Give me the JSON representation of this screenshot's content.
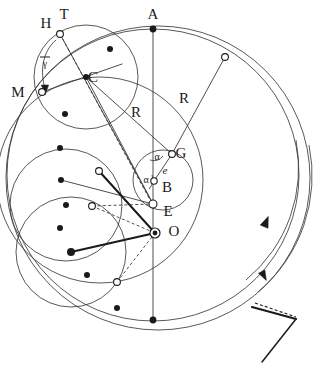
{
  "figure": {
    "background_color": "#ffffff",
    "stroke_color": "#3a3a3a",
    "stroke_color_dark": "#1a1a1a",
    "label_color": "#1a1a1a",
    "width": 317,
    "height": 375
  },
  "labels": [
    {
      "key": "A",
      "text": "A",
      "x": 153,
      "y": 16,
      "size": "large",
      "name": "label-A"
    },
    {
      "key": "T",
      "text": "T",
      "x": 64,
      "y": 16,
      "size": "large",
      "name": "label-T"
    },
    {
      "key": "H",
      "text": "H",
      "x": 46,
      "y": 25,
      "size": "large",
      "name": "label-H"
    },
    {
      "key": "M",
      "text": "M",
      "x": 18,
      "y": 94,
      "size": "large",
      "name": "label-M"
    },
    {
      "key": "C",
      "text": "C",
      "x": 93,
      "y": 79,
      "size": "large",
      "name": "label-C"
    },
    {
      "key": "G",
      "text": "G",
      "x": 181,
      "y": 155,
      "size": "large",
      "name": "label-G"
    },
    {
      "key": "B",
      "text": "B",
      "x": 167,
      "y": 189,
      "size": "large",
      "name": "label-B"
    },
    {
      "key": "E",
      "text": "E",
      "x": 168,
      "y": 213,
      "size": "large",
      "name": "label-E"
    },
    {
      "key": "O",
      "text": "O",
      "x": 174,
      "y": 233,
      "size": "large",
      "name": "label-O"
    },
    {
      "key": "R1",
      "text": "R",
      "x": 136,
      "y": 114,
      "size": "large",
      "name": "label-R-left"
    },
    {
      "key": "R2",
      "text": "R",
      "x": 184,
      "y": 100,
      "size": "large",
      "name": "label-R-right"
    },
    {
      "key": "e",
      "text": "e",
      "x": 165,
      "y": 171,
      "size": "italic",
      "name": "label-e"
    },
    {
      "key": "a1",
      "text": "α",
      "x": 157,
      "y": 158,
      "size": "small",
      "name": "label-alpha-upper"
    },
    {
      "key": "a2",
      "text": "α",
      "x": 146,
      "y": 181,
      "size": "small",
      "name": "label-alpha-lower"
    },
    {
      "key": "g",
      "text": "γ",
      "x": 45,
      "y": 65,
      "size": "small",
      "name": "label-gamma"
    }
  ],
  "gamma_overbar": {
    "x": 40,
    "y": 57,
    "width": 10,
    "name": "gamma-overbar"
  },
  "points": {
    "filled": [
      {
        "x": 153,
        "y": 29,
        "r": 3.4,
        "name": "point-A-marker"
      },
      {
        "x": 86,
        "y": 77,
        "r": 3.0,
        "name": "point-C-marker"
      },
      {
        "x": 110,
        "y": 49,
        "r": 3.0,
        "name": "point-dot-top-circle"
      },
      {
        "x": 65,
        "y": 114,
        "r": 3.0,
        "name": "point-dot-1"
      },
      {
        "x": 60,
        "y": 148,
        "r": 3.0,
        "name": "point-dot-2"
      },
      {
        "x": 61,
        "y": 180,
        "r": 3.0,
        "name": "point-dot-3"
      },
      {
        "x": 66,
        "y": 205,
        "r": 3.0,
        "name": "point-dot-4"
      },
      {
        "x": 60,
        "y": 228,
        "r": 3.0,
        "name": "point-dot-5"
      },
      {
        "x": 71,
        "y": 252,
        "r": 4.0,
        "name": "point-dot-6-thick"
      },
      {
        "x": 87,
        "y": 275,
        "r": 3.0,
        "name": "point-dot-7"
      },
      {
        "x": 117,
        "y": 308,
        "r": 3.0,
        "name": "point-dot-8"
      },
      {
        "x": 153,
        "y": 320,
        "r": 3.4,
        "name": "point-bottom-marker"
      }
    ],
    "open": [
      {
        "x": 60,
        "y": 34,
        "r": 3.4,
        "name": "point-T-marker"
      },
      {
        "x": 42,
        "y": 92,
        "r": 3.4,
        "name": "point-M-marker"
      },
      {
        "x": 225,
        "y": 57,
        "r": 3.4,
        "name": "point-upper-right-marker"
      },
      {
        "x": 172,
        "y": 154,
        "r": 3.4,
        "name": "point-G-marker"
      },
      {
        "x": 154,
        "y": 181,
        "r": 3.2,
        "name": "point-alpha-vertex-marker"
      },
      {
        "x": 153,
        "y": 204,
        "r": 4.0,
        "name": "point-E-marker"
      },
      {
        "x": 99,
        "y": 171,
        "r": 3.4,
        "name": "point-upper-left-node"
      },
      {
        "x": 92,
        "y": 206,
        "r": 3.4,
        "name": "point-mid-left-node"
      },
      {
        "x": 117,
        "y": 282,
        "r": 3.4,
        "name": "point-lower-node"
      }
    ],
    "double": [
      {
        "x": 155,
        "y": 233,
        "r_outer": 5.0,
        "r_inner": 2.4,
        "name": "point-O-marker"
      }
    ]
  },
  "circles": [
    {
      "cx": 153,
      "cy": 175,
      "r": 146,
      "name": "circle-deferent-main"
    },
    {
      "cx": 158,
      "cy": 178,
      "r": 152,
      "name": "circle-outer-secondary"
    },
    {
      "cx": 86,
      "cy": 77,
      "r": 52,
      "name": "circle-epicycle-upper"
    },
    {
      "cx": 66,
      "cy": 205,
      "r": 56,
      "name": "circle-epicycle-left"
    },
    {
      "cx": 71,
      "cy": 252,
      "r": 55,
      "name": "circle-epicycle-lower"
    },
    {
      "cx": 100,
      "cy": 180,
      "r": 103,
      "name": "circle-mid-large"
    },
    {
      "cx": 163,
      "cy": 180,
      "r": 30,
      "name": "circle-small-eccentric"
    }
  ],
  "lines": {
    "solid": [
      {
        "x1": 153,
        "y1": 29,
        "x2": 153,
        "y2": 320,
        "name": "line-vertical-axis",
        "w": 0.9
      },
      {
        "x1": 60,
        "y1": 34,
        "x2": 153,
        "y2": 204,
        "name": "line-T-to-E",
        "w": 0.9
      },
      {
        "x1": 42,
        "y1": 92,
        "x2": 122,
        "y2": 64,
        "name": "line-M-to-upper-right",
        "w": 0.9
      },
      {
        "x1": 86,
        "y1": 77,
        "x2": 172,
        "y2": 154,
        "name": "line-C-to-G-radius-R",
        "w": 0.9
      },
      {
        "x1": 172,
        "y1": 154,
        "x2": 225,
        "y2": 57,
        "name": "line-G-to-outer-radius-R",
        "w": 0.9
      },
      {
        "x1": 154,
        "y1": 181,
        "x2": 172,
        "y2": 154,
        "name": "line-e-eccentricity",
        "w": 0.9
      },
      {
        "x1": 86,
        "y1": 77,
        "x2": 153,
        "y2": 204,
        "name": "line-C-to-E",
        "w": 0.9
      },
      {
        "x1": 61,
        "y1": 180,
        "x2": 153,
        "y2": 204,
        "name": "line-dot3-to-E-horizontal",
        "w": 0.9
      },
      {
        "x1": 99,
        "y1": 171,
        "x2": 155,
        "y2": 233,
        "name": "line-node-to-O-thick",
        "w": 2.0
      },
      {
        "x1": 71,
        "y1": 252,
        "x2": 155,
        "y2": 233,
        "name": "line-dot6-to-O-thick",
        "w": 2.0
      }
    ],
    "dashed": [
      {
        "x1": 60,
        "y1": 34,
        "x2": 150,
        "y2": 200,
        "name": "line-T-to-E-dashed",
        "w": 0.9
      },
      {
        "x1": 92,
        "y1": 206,
        "x2": 155,
        "y2": 233,
        "name": "line-mid-node-to-O-dashed",
        "w": 0.9
      },
      {
        "x1": 117,
        "y1": 282,
        "x2": 155,
        "y2": 233,
        "name": "line-lower-node-to-O-dashed",
        "w": 0.9
      },
      {
        "x1": 92,
        "y1": 206,
        "x2": 153,
        "y2": 204,
        "name": "line-mid-node-to-E-dashed",
        "w": 0.9
      }
    ]
  },
  "arcs": {
    "gamma_angle": {
      "name": "arc-gamma-angle",
      "d": "M 56 40 C 42 52 40 72 45 88"
    },
    "alpha_upper": {
      "name": "arc-alpha-upper",
      "d": "M 150 160 A 12 12 0 0 0 163 156"
    },
    "alpha_lower": {
      "name": "arc-alpha-lower",
      "d": "M 149 189 A 14 14 0 0 0 152 175"
    },
    "rotation_inner": {
      "name": "arc-rotation-inner",
      "d": "M 296 140 A 146 146 0 0 1 246 280"
    },
    "rotation_outer": {
      "name": "arc-rotation-outer",
      "d": "M 309 145 A 152 152 0 0 1 258 292"
    }
  },
  "arrows": {
    "gamma_tip": {
      "x": 45,
      "y": 90,
      "dir": "down",
      "name": "arrowhead-gamma"
    },
    "rotation_inner_tip": {
      "x": 266,
      "y": 222,
      "dir": "up",
      "name": "arrowhead-rotation-ccw"
    },
    "rotation_outer_tip": {
      "x": 264,
      "y": 276,
      "dir": "down",
      "name": "arrowhead-rotation-cw"
    }
  },
  "angle_key": {
    "name": "angle-key-legend",
    "vertex_x": 296,
    "vertex_y": 319,
    "solid_arm": {
      "x1": 252,
      "y1": 307,
      "x2": 296,
      "y2": 319
    },
    "dashed_arm": {
      "x1": 255,
      "y1": 303,
      "x2": 296,
      "y2": 317
    },
    "lower_arm": {
      "x1": 296,
      "y1": 319,
      "x2": 262,
      "y2": 362
    }
  }
}
